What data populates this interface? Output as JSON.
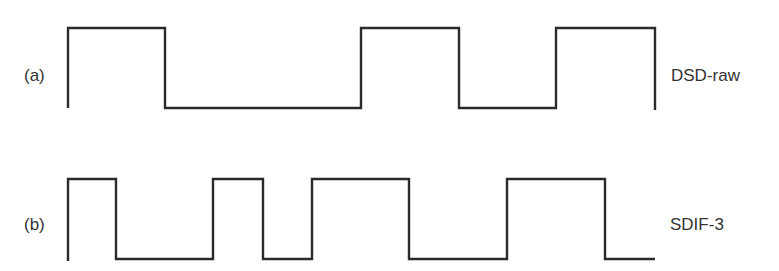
{
  "diagram": {
    "type": "digital-waveform-comparison",
    "line_color": "#2a2a2a",
    "text_color": "#333333",
    "rows": [
      {
        "id": "a",
        "tag": "(a)",
        "name": "DSD-raw",
        "high_y": 28,
        "low_y": 108,
        "bits": [
          1,
          0,
          0,
          1,
          0,
          1
        ],
        "points": "68,108 68,28 165,28 165,108 361,108 361,28 459,28 459,108 556,108 556,28 655,28 655,110"
      },
      {
        "id": "b",
        "tag": "(b)",
        "name": "SDIF-3",
        "high_y": 179,
        "low_y": 259,
        "bits": [
          1,
          0,
          0,
          1,
          0,
          1,
          1,
          0,
          0,
          1,
          1,
          0
        ],
        "points": "68,261 68,179 116,179 116,259 213,259 213,179 263,179 263,259 312,259 312,179 409,179 409,259 507,259 507,179 605,179 605,259 655,259"
      }
    ]
  }
}
